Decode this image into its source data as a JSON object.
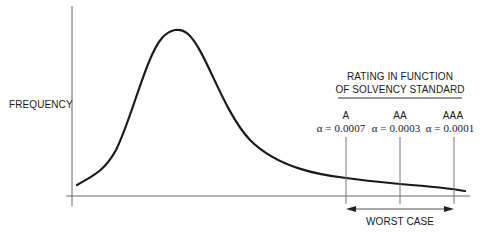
{
  "diagram": {
    "y_axis_label": "FREQUENCY",
    "header": {
      "line1": "RATING IN FUNCTION",
      "line2": "OF SOLVENCY STANDARD"
    },
    "ratings": [
      {
        "grade": "A",
        "alpha": "α = 0.0007"
      },
      {
        "grade": "AA",
        "alpha": "α = 0.0003"
      },
      {
        "grade": "AAA",
        "alpha": "α = 0.0001"
      }
    ],
    "range_label": "WORST CASE",
    "colors": {
      "curve": "#1a1a1a",
      "axis": "#555555",
      "text": "#1a1a1a"
    }
  }
}
